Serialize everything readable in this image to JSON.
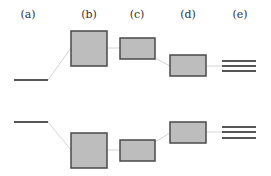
{
  "labels": [
    "(a)",
    "(b)",
    "(c)",
    "(d)",
    "(e)"
  ],
  "colors": {
    "box_fill": "#bdbdbd",
    "box_stroke": "#4a4a4a",
    "level_line": "#1e1e1e",
    "connector": "#d4d4d4",
    "text": "#333333"
  },
  "columns": [
    {
      "id": "a",
      "label": "(a)",
      "type": "single-level"
    },
    {
      "id": "b",
      "label": "(b)",
      "type": "large-box"
    },
    {
      "id": "c",
      "label": "(c)",
      "type": "medium-box"
    },
    {
      "id": "d",
      "label": "(d)",
      "type": "medium-box"
    },
    {
      "id": "e",
      "label": "(e)",
      "type": "triple-level"
    }
  ],
  "rows": [
    {
      "id": "upper",
      "description": "upper level split; (d) box lower than (c)"
    },
    {
      "id": "lower",
      "description": "lower level split; (d) box higher than (c)"
    }
  ]
}
